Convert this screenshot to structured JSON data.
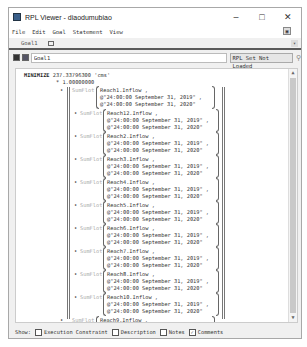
{
  "window": {
    "title": "RPL Viewer - diaodumubiao",
    "controls": {
      "minimize": "–",
      "maximize": "□",
      "close": "✕"
    }
  },
  "menu": {
    "items": [
      "File",
      "Edit",
      "Goal",
      "Statement",
      "View"
    ],
    "restore_icon": "▣"
  },
  "tabs": {
    "items": [
      {
        "label": "Goal1"
      }
    ],
    "menu_icon": "▾"
  },
  "toolbar": {
    "goal_name_value": "Goal1",
    "rpl_status_button": "RPL Set Not Loaded",
    "pin_icon": "⚲"
  },
  "expression": {
    "function": "MINIMIZE",
    "coefficient": "237.33796300",
    "units": "'cms'",
    "operator": "* 1.00000000",
    "sum_label": "SumFlot",
    "line_marker": "•",
    "start_date": "@\"24:00:00 September 31, 2019\" ,",
    "end_date": "@\"24:00:00 September 31, 2020\"",
    "reaches": [
      "Reach1.Inflow ,",
      "Reach12.Inflow ,",
      "Reach2.Inflow ,",
      "Reach3.Inflow ,",
      "Reach4.Inflow ,",
      "Reach5.Inflow ,",
      "Reach6.Inflow ,",
      "Reach7.Inflow ,",
      "Reach8.Inflow ,",
      "Reach10.Inflow ,",
      "Reach9.Inflow ,"
    ]
  },
  "scrollbar": {
    "up": "▲",
    "down": "▼"
  },
  "footer": {
    "show_label": "Show:",
    "options": [
      {
        "label": "Execution Constraint",
        "checked": false
      },
      {
        "label": "Description",
        "checked": false
      },
      {
        "label": "Notes",
        "checked": false
      },
      {
        "label": "Comments",
        "checked": true
      }
    ],
    "check_mark": "✓"
  }
}
